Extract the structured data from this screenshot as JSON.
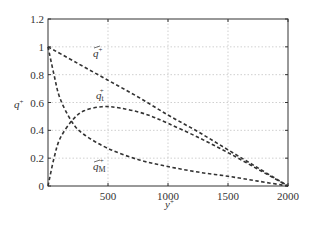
{
  "chart_data": {
    "type": "line",
    "title": "",
    "xlabel": "y⁺",
    "ylabel": "q⁺",
    "xlim": [
      0,
      2000
    ],
    "ylim": [
      0,
      1.2
    ],
    "grid": true,
    "legend": "none (inline annotations)",
    "x_ticks": [
      "500",
      "1000",
      "1500",
      "2000"
    ],
    "y_ticks": [
      "0",
      "0.2",
      "0.4",
      "0.6",
      "0.8",
      "1",
      "1.2"
    ],
    "series": [
      {
        "name": "q̄⁺",
        "style": "dashed",
        "x": [
          0,
          250,
          500,
          750,
          1000,
          1250,
          1500,
          1750,
          2000
        ],
        "values": [
          1.0,
          0.88,
          0.76,
          0.64,
          0.51,
          0.39,
          0.26,
          0.13,
          0.0
        ]
      },
      {
        "name": "q_t⁺",
        "style": "dashed",
        "x": [
          0,
          50,
          100,
          200,
          300,
          450,
          600,
          800,
          1000,
          1250,
          1500,
          1750,
          2000
        ],
        "values": [
          0.0,
          0.2,
          0.34,
          0.47,
          0.54,
          0.57,
          0.56,
          0.52,
          0.45,
          0.35,
          0.24,
          0.12,
          0.0
        ]
      },
      {
        "name": "q̄_M⁺",
        "style": "dashed",
        "x": [
          0,
          50,
          100,
          200,
          300,
          500,
          750,
          1000,
          1250,
          1500,
          1750,
          2000
        ],
        "values": [
          1.0,
          0.8,
          0.63,
          0.46,
          0.37,
          0.27,
          0.19,
          0.14,
          0.1,
          0.07,
          0.035,
          0.0
        ]
      }
    ],
    "annotations": [
      {
        "text": "q̄⁺",
        "x": 520,
        "y": 0.84
      },
      {
        "text": "q_t⁺",
        "x": 500,
        "y": 0.64
      },
      {
        "text": "q̄_M⁺",
        "x": 500,
        "y": 0.12
      }
    ]
  },
  "labels": {
    "xlabel_main": "y",
    "xlabel_sup": "+",
    "ylabel_main": "q",
    "ylabel_sup": "+",
    "anno_qbar_main": "q",
    "anno_qbar_sup": "+",
    "anno_qt_main": "q",
    "anno_qt_sub": "t",
    "anno_qt_sup": "+",
    "anno_qm_main": "q",
    "anno_qm_sub": "M",
    "anno_qm_sup": "+"
  }
}
